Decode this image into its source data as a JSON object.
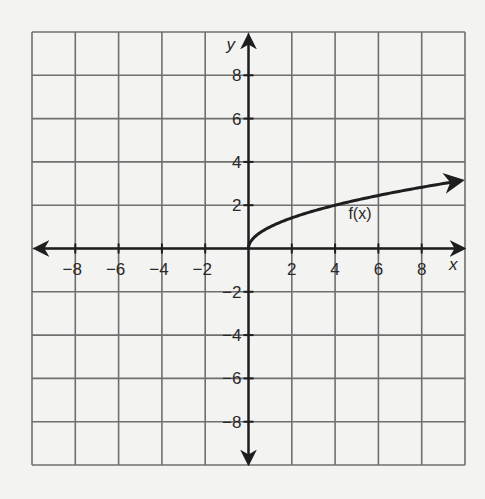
{
  "chart_data": {
    "type": "line",
    "title": "",
    "xlabel": "x",
    "ylabel": "y",
    "xlim": [
      -10,
      10
    ],
    "ylim": [
      -10,
      10
    ],
    "grid": true,
    "grid_step": 2,
    "x_ticks": [
      -8,
      -6,
      -4,
      -2,
      2,
      4,
      6,
      8
    ],
    "y_ticks": [
      8,
      6,
      4,
      2,
      -2,
      -4,
      -6,
      -8
    ],
    "x_tick_labels": [
      "−8",
      "−6",
      "−4",
      "−2",
      "2",
      "4",
      "6",
      "8"
    ],
    "y_tick_labels": [
      "8",
      "6",
      "4",
      "2",
      "−2",
      "−4",
      "−6",
      "−8"
    ],
    "legend": [],
    "annotations": [
      {
        "text": "f(x)",
        "x": 4.8,
        "y": 1.5
      }
    ],
    "series": [
      {
        "name": "f(x)",
        "description": "square-root curve starting at origin, arrow continues right",
        "x": [
          0,
          0.25,
          1,
          2,
          3,
          4,
          5,
          6,
          7,
          8,
          9,
          9.8
        ],
        "y": [
          0,
          0.5,
          1,
          1.41,
          1.73,
          2,
          2.24,
          2.45,
          2.65,
          2.83,
          3,
          3.13
        ],
        "start_point": [
          0,
          0
        ],
        "end_arrow": true
      }
    ]
  },
  "labels": {
    "x_axis": "x",
    "y_axis": "y",
    "function": "f(x)"
  }
}
